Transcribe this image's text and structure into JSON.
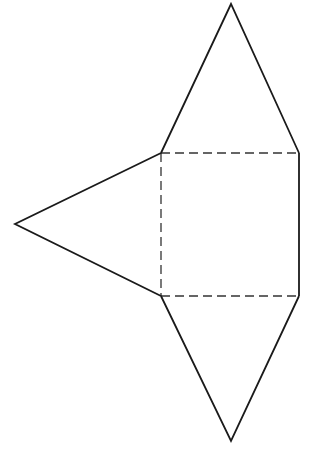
{
  "diagram": {
    "type": "pyramid-net",
    "stroke_color": "#1a1a1a",
    "background": "#ffffff",
    "square": {
      "corners": [
        [
          161,
          153
        ],
        [
          299,
          153
        ],
        [
          299,
          296
        ],
        [
          161,
          296
        ]
      ],
      "fold_edges_dashed": [
        "top",
        "left",
        "bottom"
      ],
      "solid_edges": [
        "right"
      ]
    },
    "triangles": [
      {
        "name": "top-face",
        "apex": [
          231,
          4
        ],
        "base": [
          [
            161,
            153
          ],
          [
            299,
            153
          ]
        ]
      },
      {
        "name": "bottom-face",
        "apex": [
          231,
          441
        ],
        "base": [
          [
            161,
            296
          ],
          [
            299,
            296
          ]
        ]
      },
      {
        "name": "left-face",
        "apex": [
          15,
          224
        ],
        "base": [
          [
            161,
            153
          ],
          [
            161,
            296
          ]
        ]
      }
    ]
  }
}
